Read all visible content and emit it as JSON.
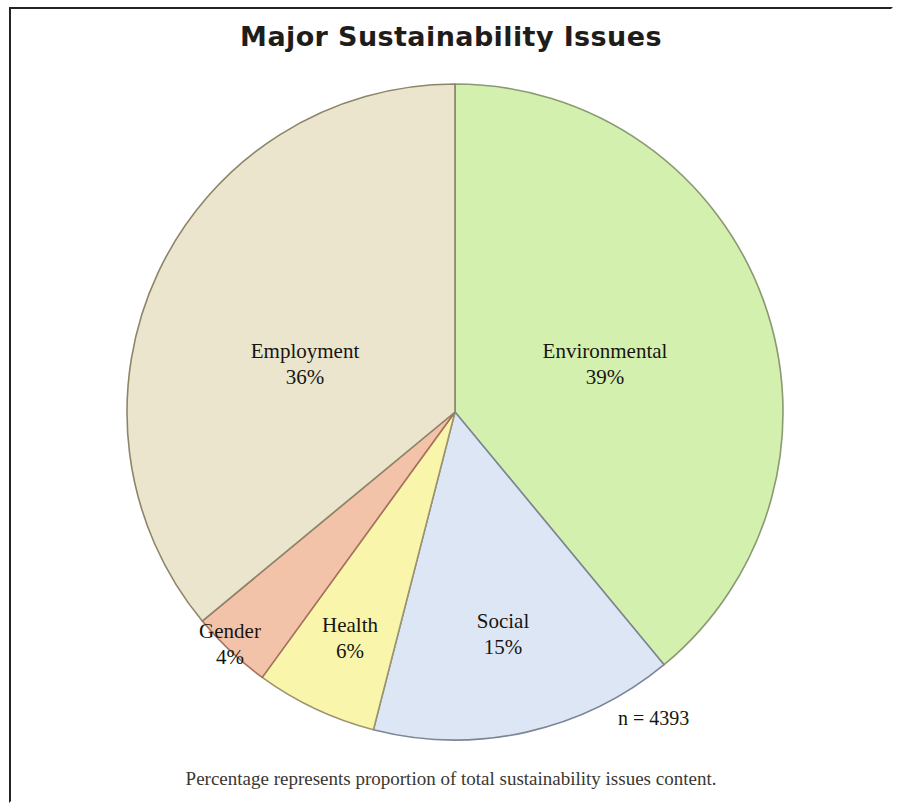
{
  "figure": {
    "title": "Major Sustainability Issues",
    "sample_size_label": "n = 4393",
    "footnote": "Percentage represents proportion of total sustainability issues content.",
    "frame_color": "#262420",
    "background": "#ffffff"
  },
  "chart_data": {
    "type": "pie",
    "title": "Major Sustainability Issues",
    "xlabel": "",
    "ylabel": "",
    "categories": [
      "Environmental",
      "Social",
      "Health",
      "Gender",
      "Employment"
    ],
    "values": [
      39,
      15,
      6,
      4,
      36
    ],
    "value_unit": "%",
    "start_angle_deg": 0,
    "direction": "clockwise",
    "total_n": 4393,
    "legend": "none",
    "grid": false,
    "annotations": [
      "n = 4393",
      "Percentage represents proportion of total sustainability issues content."
    ],
    "slices": [
      {
        "label": "Environmental",
        "percent_label": "39%",
        "value": 39,
        "color": "#d3f0ae",
        "stroke": "#8a9a72"
      },
      {
        "label": "Social",
        "percent_label": "15%",
        "value": 15,
        "color": "#dce6f5",
        "stroke": "#7d8596"
      },
      {
        "label": "Health",
        "percent_label": "6%",
        "value": 6,
        "color": "#f9f5ab",
        "stroke": "#9b9470"
      },
      {
        "label": "Gender",
        "percent_label": "4%",
        "value": 4,
        "color": "#f2c3a8",
        "stroke": "#a8705a"
      },
      {
        "label": "Employment",
        "percent_label": "36%",
        "value": 36,
        "color": "#eae5cc",
        "stroke": "#8d8569"
      }
    ]
  }
}
